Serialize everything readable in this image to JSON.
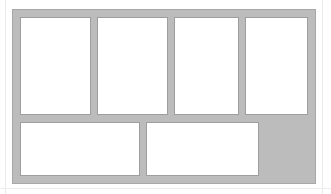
{
  "document": {
    "background_color": "#ffffff",
    "guides": [
      {
        "name": "left-margin-guide",
        "orientation": "vertical",
        "color": "#e9e9e9"
      },
      {
        "name": "right-margin-guide",
        "orientation": "vertical",
        "color": "#e9e9e9"
      },
      {
        "name": "bottom-margin-guide",
        "orientation": "horizontal",
        "color": "#ededed"
      }
    ]
  },
  "layout_frame": {
    "name": "layout-template-frame",
    "fill_color": "#bcbcbc",
    "border_color": "#a8a8a8",
    "rows": 2,
    "columns": 4,
    "total_slots": 6,
    "empty_slots": 1
  },
  "slots": {
    "top_row": [
      {
        "id": "slot-1",
        "orientation": "portrait",
        "state": "empty",
        "fill": "#ffffff",
        "stroke": "#9e9e9e"
      },
      {
        "id": "slot-2",
        "orientation": "portrait",
        "state": "empty",
        "fill": "#ffffff",
        "stroke": "#9e9e9e"
      },
      {
        "id": "slot-3",
        "orientation": "portrait",
        "state": "empty",
        "fill": "#ffffff",
        "stroke": "#9e9e9e"
      },
      {
        "id": "slot-4",
        "orientation": "portrait",
        "state": "empty",
        "fill": "#ffffff",
        "stroke": "#9e9e9e"
      }
    ],
    "bottom_row": [
      {
        "id": "slot-5",
        "orientation": "landscape",
        "state": "empty",
        "fill": "#ffffff",
        "stroke": "#9e9e9e"
      },
      {
        "id": "slot-6",
        "orientation": "landscape",
        "state": "empty",
        "fill": "#ffffff",
        "stroke": "#9e9e9e"
      },
      {
        "id": "slot-7",
        "orientation": "none",
        "state": "unused",
        "fill": "#bcbcbc",
        "stroke": "none"
      }
    ]
  }
}
